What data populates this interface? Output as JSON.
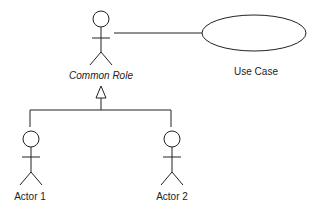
{
  "diagram": {
    "type": "uml-use-case",
    "actors": [
      {
        "id": "common-role",
        "label": "Common Role",
        "italic": true,
        "cx": 101,
        "head_cy": 19
      },
      {
        "id": "actor-1",
        "label": "Actor 1",
        "italic": false,
        "cx": 31,
        "head_cy": 140
      },
      {
        "id": "actor-2",
        "label": "Actor 2",
        "italic": false,
        "cx": 172,
        "head_cy": 140
      }
    ],
    "use_cases": [
      {
        "id": "use-case",
        "label": "Use Case",
        "cx": 254,
        "cy": 33,
        "rx": 52,
        "ry": 18
      }
    ],
    "relations": [
      {
        "type": "association",
        "from": "common-role",
        "to": "use-case"
      },
      {
        "type": "generalization",
        "from": "actor-1",
        "to": "common-role"
      },
      {
        "type": "generalization",
        "from": "actor-2",
        "to": "common-role"
      }
    ],
    "colors": {
      "line": "#222222",
      "background": "#ffffff"
    }
  }
}
